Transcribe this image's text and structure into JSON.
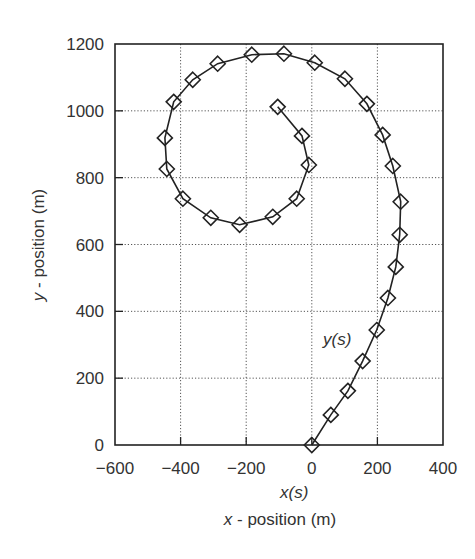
{
  "chart_data": {
    "type": "line",
    "title": "",
    "xlabel": "x - position (m)",
    "xlabel_italic_part": "x",
    "ylabel": "y - position (m)",
    "ylabel_italic_part": "y",
    "xlim": [
      -600,
      400
    ],
    "ylim": [
      0,
      1200
    ],
    "xticks": [
      -600,
      -400,
      -200,
      0,
      200,
      400
    ],
    "yticks": [
      0,
      200,
      400,
      600,
      800,
      1000,
      1200
    ],
    "xtick_labels": [
      "−600",
      "−400",
      "−200",
      "0",
      "200",
      "400"
    ],
    "ytick_labels": [
      "0",
      "200",
      "400",
      "600",
      "800",
      "1000",
      "1200"
    ],
    "grid": true,
    "grid_style": "dotted",
    "legend": null,
    "annotations": [
      {
        "text": "x(s)",
        "italic": true,
        "position": "below x-axis at x=-100"
      },
      {
        "text": "y(s)",
        "italic": true,
        "x": 70,
        "y": 320
      }
    ],
    "series": [
      {
        "name": "trajectory",
        "marker": "diamond-open",
        "line": "solid",
        "color": "#222222",
        "x": [
          0,
          58,
          110,
          155,
          198,
          232,
          256,
          268,
          271,
          247,
          216,
          168,
          101,
          9,
          -85,
          -183,
          -287,
          -363,
          -421,
          -448,
          -442,
          -393,
          -308,
          -220,
          -119,
          -46,
          -9,
          -30,
          -104
        ],
        "y": [
          0,
          90,
          162,
          251,
          344,
          440,
          533,
          629,
          728,
          835,
          928,
          1021,
          1096,
          1144,
          1171,
          1168,
          1141,
          1093,
          1027,
          919,
          826,
          737,
          680,
          659,
          683,
          737,
          838,
          925,
          1012
        ]
      }
    ]
  },
  "labels": {
    "xs": "x(s)",
    "ys": "y(s)",
    "xlabel_var": "x",
    "xlabel_rest": " - position (m)",
    "ylabel_var": "y",
    "ylabel_rest": " - position (m)"
  },
  "colors": {
    "axis": "#222222",
    "grid": "#555555",
    "text": "#333333",
    "series": "#222222",
    "background": "#ffffff"
  }
}
